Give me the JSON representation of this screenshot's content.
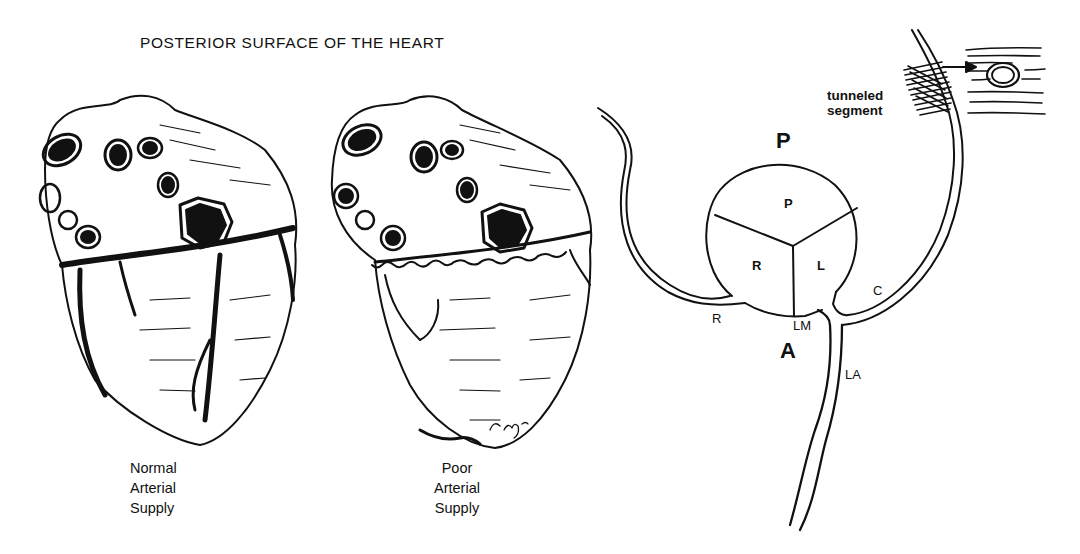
{
  "title": "POSTERIOR SURFACE OF THE HEART",
  "hearts": [
    {
      "caption_lines": [
        "Normal",
        "Arterial",
        "Supply"
      ]
    },
    {
      "caption_lines": [
        "Poor",
        "Arterial",
        "Supply"
      ],
      "signature": "T.Spray"
    }
  ],
  "schematic": {
    "top_label": "P",
    "bottom_label": "A",
    "valve_cusps": [
      "P",
      "R",
      "L"
    ],
    "vessel_labels": {
      "right": "R",
      "left_main": "LM",
      "circumflex": "C",
      "left_anterior": "LA"
    },
    "tunneled_label_lines": [
      "tunneled",
      "segment"
    ]
  },
  "colors": {
    "ink": "#111111",
    "background": "#ffffff"
  }
}
